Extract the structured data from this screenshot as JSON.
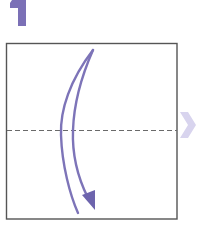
{
  "step": {
    "number": "1",
    "color": "#7b70b6"
  },
  "diagram": {
    "paper": {
      "shape": "square",
      "x": 6,
      "y": 43,
      "width": 171,
      "height": 176,
      "border_color": "#555555",
      "fill": "#ffffff"
    },
    "fold_line": {
      "type": "valley-fold-dashed",
      "y": 130,
      "x1": 6,
      "x2": 177,
      "color": "#6a6a6a",
      "dash": [
        5,
        3
      ]
    },
    "fold_arrow": {
      "direction": "top-to-bottom",
      "stroke_color": "#7d74b8",
      "head_color": "#6d64ad"
    },
    "next_step_chevron": {
      "icon": "chevron-right-icon",
      "color": "#d8d4ee"
    }
  }
}
